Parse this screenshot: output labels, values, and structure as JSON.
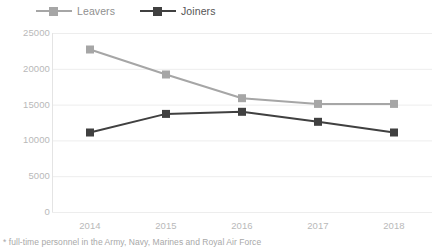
{
  "legend": {
    "position": "top-left",
    "items": [
      {
        "label": "Leavers",
        "color": "#a6a6a6",
        "marker": "square"
      },
      {
        "label": "Joiners",
        "color": "#404040",
        "marker": "square"
      }
    ]
  },
  "footnote": "* full-time personnel in the Army, Navy, Marines and Royal Air Force",
  "axis": {
    "y_ticks": [
      "0",
      "5000",
      "10000",
      "15000",
      "20000",
      "25000"
    ],
    "x_ticks": [
      "2014",
      "2015",
      "2016",
      "2017",
      "2018"
    ],
    "tick_color": "#b9b9b9",
    "grid_color": "#ededed"
  },
  "chart_data": {
    "type": "line",
    "title": "",
    "subtitle": "",
    "xlabel": "",
    "ylabel": "",
    "categories": [
      "2014",
      "2015",
      "2016",
      "2017",
      "2018"
    ],
    "series": [
      {
        "name": "Leavers",
        "color": "#a6a6a6",
        "values": [
          22700,
          19200,
          15900,
          15100,
          15100
        ]
      },
      {
        "name": "Joiners",
        "color": "#404040",
        "values": [
          11100,
          13700,
          14000,
          12600,
          11100
        ]
      }
    ],
    "ylim": [
      0,
      25000
    ],
    "ytick_values": [
      0,
      5000,
      10000,
      15000,
      20000,
      25000
    ],
    "grid": "horizontal",
    "legend_position": "top-left",
    "annotations": [
      "* full-time personnel in the Army, Navy, Marines and Royal Air Force"
    ]
  }
}
